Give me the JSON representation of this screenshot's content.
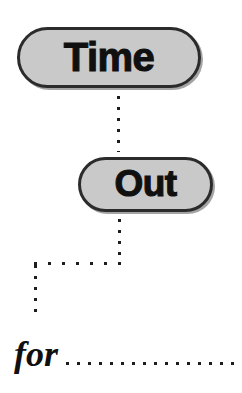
{
  "page": {
    "background_color": "#ffffff",
    "width": 242,
    "height": 393
  },
  "style": {
    "pill_fill": "#c9c9c9",
    "pill_border": "#2b2b2b",
    "text_color": "#101010",
    "dot_color": "#1d1d1d"
  },
  "headline": {
    "word_1": "Time",
    "word_2": "Out"
  },
  "caption": {
    "prefix": "for",
    "blank_line_label": "dotted-fill-in-blank"
  },
  "connectors": {
    "time_to_out": "vertical-dotted-line",
    "out_down": "vertical-dotted-line",
    "leftward": "horizontal-dotted-line",
    "down_to_for": "vertical-dotted-line"
  }
}
